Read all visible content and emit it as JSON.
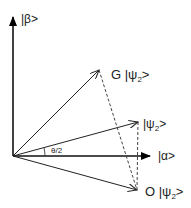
{
  "diagram": {
    "axes": {
      "vertical_label": "|β>",
      "horizontal_label": "|α>"
    },
    "vectors": [
      {
        "id": "G_psi2",
        "label_prefix": "G |ψ",
        "label_sub": "2",
        "label_suffix": ">"
      },
      {
        "id": "psi2",
        "label_prefix": "|ψ",
        "label_sub": "2",
        "label_suffix": ">"
      },
      {
        "id": "O_psi2",
        "label_prefix": "O |ψ",
        "label_sub": "2",
        "label_suffix": ">"
      }
    ],
    "angle_label": "θ/2",
    "colors": {
      "line": "#222222",
      "dashed": "#444444",
      "background": "#ffffff"
    }
  }
}
